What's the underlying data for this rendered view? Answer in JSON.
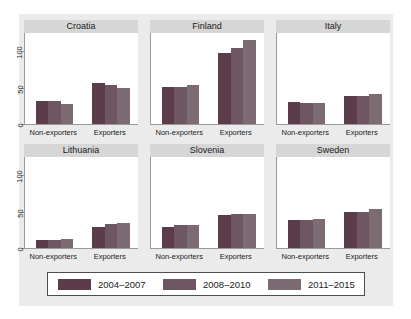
{
  "chart_data": {
    "type": "bar",
    "title": "",
    "subtitle": "",
    "xlabel": "",
    "ylabel": "",
    "ylim": [
      0,
      125
    ],
    "yticks": [
      0,
      50,
      100
    ],
    "ytick_labels": [
      "0",
      "50",
      "100"
    ],
    "grid": false,
    "legend_position": "bottom",
    "categories": [
      "Non-exporters",
      "Exporters"
    ],
    "series": [
      {
        "name": "2004–2007",
        "color": "#5c3b4a"
      },
      {
        "name": "2008–2010",
        "color": "#6e5663"
      },
      {
        "name": "2011–2015",
        "color": "#7d6b74"
      }
    ],
    "panels": [
      {
        "title": "Croatia",
        "values": {
          "Non-exporters": [
            32,
            31,
            28
          ],
          "Exporters": [
            56,
            53,
            49
          ]
        }
      },
      {
        "title": "Finland",
        "values": {
          "Non-exporters": [
            51,
            51,
            54
          ],
          "Exporters": [
            98,
            104,
            115
          ]
        }
      },
      {
        "title": "Italy",
        "values": {
          "Non-exporters": [
            30,
            29,
            29
          ],
          "Exporters": [
            38,
            38,
            41
          ]
        }
      },
      {
        "title": "Lithuania",
        "values": {
          "Non-exporters": [
            11,
            11,
            13
          ],
          "Exporters": [
            29,
            33,
            35
          ]
        }
      },
      {
        "title": "Slovenia",
        "values": {
          "Non-exporters": [
            29,
            31,
            32
          ],
          "Exporters": [
            45,
            47,
            47
          ]
        }
      },
      {
        "title": "Sweden",
        "values": {
          "Non-exporters": [
            38,
            39,
            40
          ],
          "Exporters": [
            49,
            50,
            53
          ]
        }
      }
    ]
  },
  "legend": {
    "items": [
      {
        "label": "2004–2007",
        "color": "#5c3b4a"
      },
      {
        "label": "2008–2010",
        "color": "#6e5663"
      },
      {
        "label": "2011–2015",
        "color": "#7d6b74"
      }
    ]
  },
  "colors": {
    "graph_region": "#ebebeb",
    "plot_background": "#ffffff",
    "panel_title_strip": "#d6d6d6",
    "axis": "#9a9a9a",
    "text": "#1a1a1a"
  }
}
